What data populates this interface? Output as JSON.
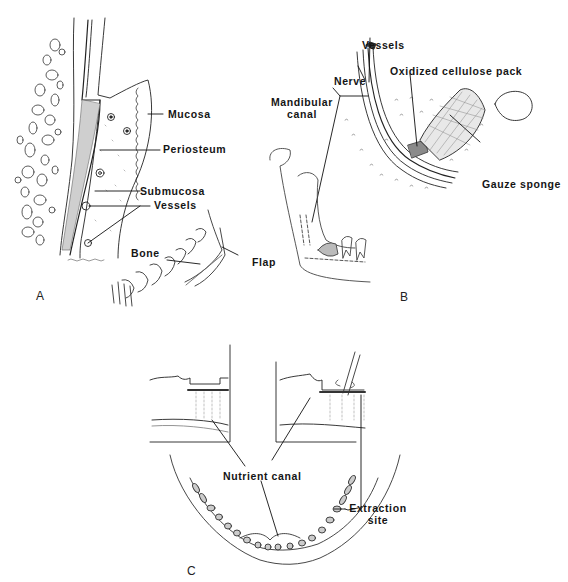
{
  "figure": {
    "panels": [
      {
        "id": "A",
        "letter": "A",
        "labels": {
          "mucosa": "Mucosa",
          "periosteum": "Periosteum",
          "submucosa": "Submucosa",
          "vessels": "Vessels",
          "bone": "Bone",
          "flap": "Flap"
        }
      },
      {
        "id": "B",
        "letter": "B",
        "labels": {
          "vessels": "Vessels",
          "nerve": "Nerve",
          "oxidized_cellulose_pack": "Oxidized cellulose pack",
          "mandibular_canal_line1": "Mandibular",
          "mandibular_canal_line2": "canal",
          "gauze_sponge": "Gauze sponge"
        }
      },
      {
        "id": "C",
        "letter": "C",
        "labels": {
          "nutrient_canal": "Nutrient canal",
          "extraction_site_line1": "Extraction",
          "extraction_site_line2": "site"
        }
      }
    ],
    "colors": {
      "background": "#ffffff",
      "ink": "#151515",
      "shading": "#9a9a9a"
    }
  }
}
